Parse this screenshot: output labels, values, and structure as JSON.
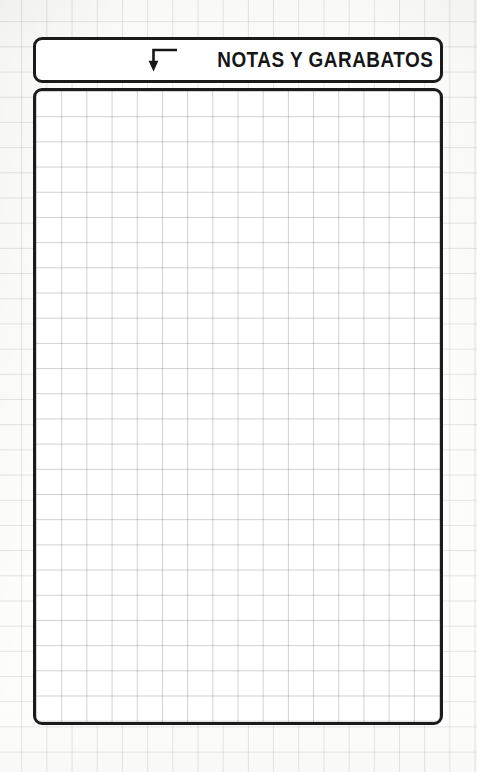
{
  "page": {
    "background_color": "#fdfdfc",
    "ink_color": "#1b1b1b",
    "grid_line_color": "#d9dcdf",
    "notes_grid_line_color": "#d2d5d9",
    "grid_cell_px": 25
  },
  "header": {
    "title": "NOTAS Y GARABATOS",
    "arrow_icon": "arrow-elbow-down-icon"
  },
  "notes": {
    "content": "",
    "placeholder": ""
  }
}
